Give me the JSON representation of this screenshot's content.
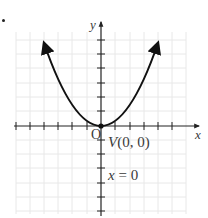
{
  "figure": {
    "bullet": "•",
    "function": "y = x^2",
    "axes": {
      "x_label": "x",
      "y_label": "y",
      "origin_label": "O"
    },
    "annotations": {
      "vertex": "V(0, 0)",
      "axis_of_symmetry": "x = 0"
    },
    "colors": {
      "curve": "#111111",
      "axis": "#222222",
      "grid": "#e6e6e6",
      "label": "#3a3a3a"
    }
  },
  "chart_data": {
    "type": "line",
    "title": "",
    "xlabel": "x",
    "ylabel": "y",
    "xlim": [
      -6,
      6
    ],
    "ylim": [
      -6,
      7
    ],
    "grid": true,
    "series": [
      {
        "name": "y = x^2",
        "x": [
          -2.4,
          -2,
          -1.5,
          -1,
          -0.5,
          0,
          0.5,
          1,
          1.5,
          2,
          2.4
        ],
        "y": [
          5.76,
          4,
          2.25,
          1,
          0.25,
          0,
          0.25,
          1,
          2.25,
          4,
          5.76
        ]
      }
    ],
    "points": [
      {
        "label": "V(0, 0)",
        "x": 0,
        "y": 0
      }
    ],
    "annotations": [
      "V(0, 0)",
      "x = 0",
      "O"
    ]
  }
}
